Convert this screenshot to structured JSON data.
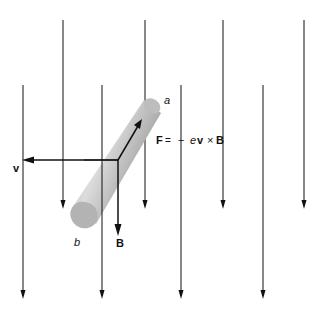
{
  "diagram": {
    "labels": {
      "end_a": "a",
      "end_b": "b",
      "velocity": "v",
      "field": "B",
      "force_F": "F",
      "force_eq": "=",
      "force_minus": "−",
      "force_e": "e",
      "force_v": "v",
      "force_cross": "×",
      "force_B": "B"
    },
    "field_lines": {
      "direction": "down",
      "back_row_count": 4,
      "front_row_count": 4
    },
    "colors": {
      "line": "#111111",
      "rod_light": "#d4d4d4",
      "rod_dark": "#8a8a8a",
      "cap": "#b5b5b5"
    }
  }
}
